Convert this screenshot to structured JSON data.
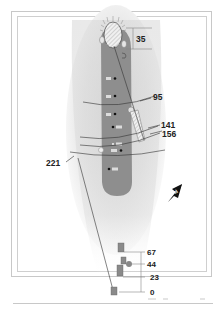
{
  "hole_diagram": {
    "green_depth": "35",
    "distances_to_green": [
      {
        "label": "95",
        "side": "right"
      },
      {
        "label": "141",
        "side": "right"
      },
      {
        "label": "156",
        "side": "right"
      },
      {
        "label": "221",
        "side": "left"
      }
    ],
    "tee_offsets": [
      {
        "label": "67"
      },
      {
        "label": "44"
      },
      {
        "label": "23"
      },
      {
        "label": "0"
      }
    ],
    "north_arrow": "N",
    "colors": {
      "fairway": "#8c8c8c",
      "rough_shade": "#d9d9d9",
      "tee_box": "#8a8a8a",
      "green": "#eaeaea",
      "line": "#333333",
      "frame": "#c8c8c8"
    }
  }
}
